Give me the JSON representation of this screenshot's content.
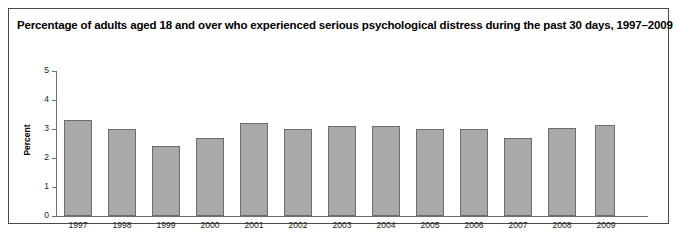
{
  "figure": {
    "title": "Percentage of adults aged 18 and over who experienced serious psychological distress during the past 30 days, 1997–2009",
    "border_color": "#4a4a4a",
    "background": "#ffffff"
  },
  "chart_data": {
    "type": "bar",
    "title": "Percentage of adults aged 18 and over who experienced serious psychological distress during the past 30 days, 1997–2009",
    "xlabel": "",
    "ylabel": "Percent",
    "categories": [
      "1997",
      "1998",
      "1999",
      "2000",
      "2001",
      "2002",
      "2003",
      "2004",
      "2005",
      "2006",
      "2007",
      "2008",
      "2009"
    ],
    "values": [
      3.3,
      3.0,
      2.4,
      2.7,
      3.2,
      3.0,
      3.1,
      3.1,
      3.0,
      3.0,
      2.7,
      3.05,
      3.15
    ],
    "ylim": [
      0,
      5
    ],
    "yticks": [
      "0",
      "1",
      "2",
      "3",
      "4",
      "5"
    ],
    "grid": false,
    "legend": false,
    "bar_color": "#a9a9a9",
    "bar_border_color": "#6d6d6d",
    "axis_color": "#6e6e6e"
  }
}
